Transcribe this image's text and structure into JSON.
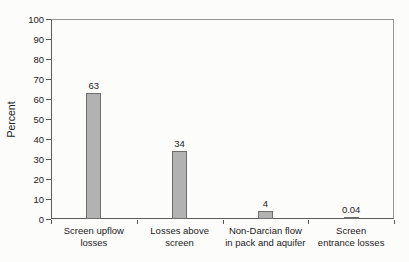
{
  "chart_data": {
    "type": "bar",
    "title": "",
    "xlabel": "",
    "ylabel": "Percent",
    "ylim": [
      0,
      100
    ],
    "ytick_step": 10,
    "grid": false,
    "legend_position": "none",
    "categories": [
      "Screen upflow losses",
      "Losses above screen",
      "Non-Darcian flow in pack and aquifer",
      "Screen entrance losses"
    ],
    "category_label_lines": [
      [
        "Screen upflow",
        "losses"
      ],
      [
        "Losses above",
        "screen"
      ],
      [
        "Non-Darcian flow",
        "in pack and aquifer"
      ],
      [
        "Screen",
        "entrance losses"
      ]
    ],
    "values": [
      63,
      34,
      4,
      0.04
    ],
    "value_labels": [
      "63",
      "34",
      "4",
      "0.04"
    ],
    "colors": {
      "bar_fill": "#b2b2b2",
      "bar_border": "#6e6e6e",
      "axis": "#5c5c5c",
      "box": "#979797",
      "text": "#222222"
    }
  }
}
